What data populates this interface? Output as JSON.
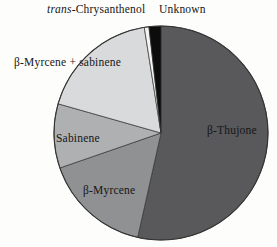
{
  "figure": {
    "background_color": "#fdfdfb",
    "text_color": "#161616"
  },
  "chart_data": {
    "type": "pie",
    "title": "",
    "direction": "clockwise",
    "start_angle_deg": 0,
    "legend": "none",
    "outline_color": "#333333",
    "slices": [
      {
        "label": "β-Thujone",
        "value_pct": 53.5,
        "color": "#59595b"
      },
      {
        "label": "β-Myrcene",
        "value_pct": 16.2,
        "color": "#8f9193"
      },
      {
        "label": "Sabinene",
        "value_pct": 9.7,
        "color": "#aeb0b2"
      },
      {
        "label": "β-Myrcene + sabinene",
        "value_pct": 18.1,
        "color": "#d9dadb"
      },
      {
        "label": "trans-Chrysanthenol",
        "value_pct": 0.7,
        "color": "#f4f4f2",
        "label_italic_prefix": "trans",
        "label_rest": "-Chrysanthenol"
      },
      {
        "label": "Unknown",
        "value_pct": 1.8,
        "color": "#0c0c0c"
      }
    ]
  }
}
